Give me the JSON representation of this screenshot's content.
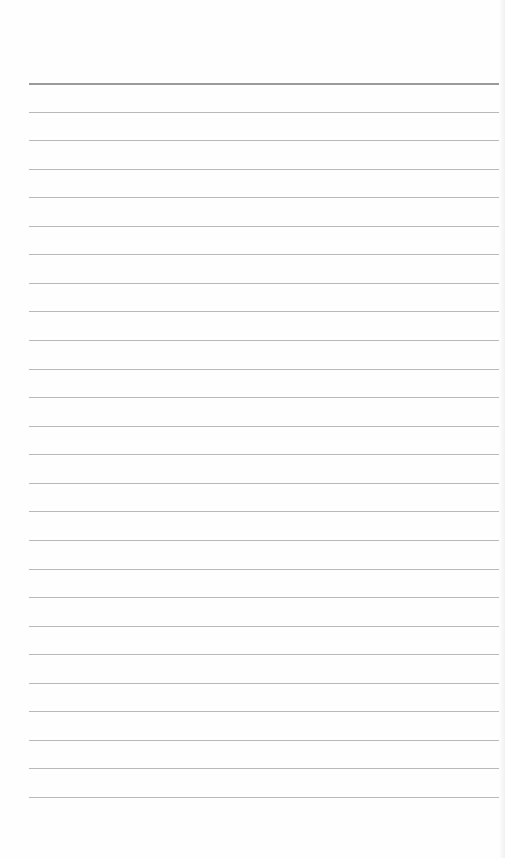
{
  "document": {
    "type": "ruled-paper",
    "line_count": 26,
    "first_line_y": 83,
    "line_spacing": 28.56,
    "line_left": 29,
    "line_width": 470,
    "colors": {
      "paper": "#fefefe",
      "top_line": "#9a9a9a",
      "rule_line": "#b9b9b9"
    },
    "text": []
  }
}
